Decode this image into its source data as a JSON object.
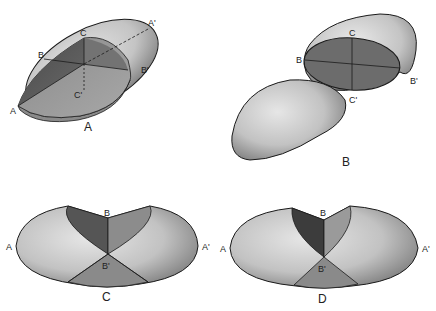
{
  "figure": {
    "panels": [
      {
        "id": "A",
        "caption": "A",
        "labels": {
          "a": "A",
          "a_prime": "A'",
          "b": "B",
          "b_prime": "B'",
          "c": "C",
          "c_prime": "C'"
        }
      },
      {
        "id": "B",
        "caption": "B",
        "labels": {
          "b": "B",
          "b_prime": "B'",
          "c": "C",
          "c_prime": "C'"
        }
      },
      {
        "id": "C",
        "caption": "C",
        "labels": {
          "a": "A",
          "a_prime": "A'",
          "b": "B",
          "b_prime": "B'"
        }
      },
      {
        "id": "D",
        "caption": "D",
        "labels": {
          "a": "A",
          "a_prime": "A'",
          "b": "B",
          "b_prime": "B'"
        }
      }
    ],
    "colors": {
      "outline": "#1a1a1a",
      "surface_light": "#d6d6d6",
      "surface_mid": "#9a9a9a",
      "section_dark": "#5a5a5a",
      "section_mid": "#7d7d7d"
    }
  }
}
